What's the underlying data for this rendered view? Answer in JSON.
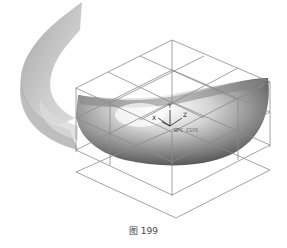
{
  "figure": {
    "caption": "图 199",
    "axes": {
      "x": "X",
      "y": "Y",
      "z": "Z"
    },
    "csys_label": "WPC CSYS"
  },
  "colors": {
    "background": "#ffffff",
    "grid_lines": "#8a8a8a",
    "surface_light": "#e6e6e6",
    "surface_dark": "#555555",
    "ribbon": "#b5b5b5"
  }
}
